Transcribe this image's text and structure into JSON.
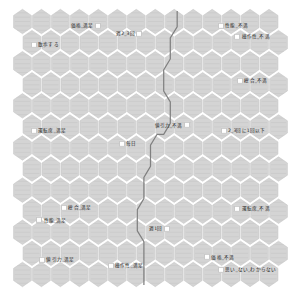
{
  "figure": {
    "title": "",
    "type": "self-organizing-map",
    "background_color": "#ffffff",
    "hex_fill_color": "#d4d4d4",
    "hex_stroke_color": "#c2c2c2",
    "hex_pattern_color": "#c9c9c9",
    "cluster_boundary_color": "#808080",
    "marker_color": "#ffffff",
    "label_color": "#1a1a1a",
    "grid_columns": 14,
    "grid_rows": 13
  },
  "chart_data": {
    "type": "heatmap",
    "title": "",
    "xlabel": "",
    "ylabel": "",
    "grid": {
      "shape": "hexagonal",
      "columns": 14,
      "rows": 13,
      "offset_rows": "odd"
    },
    "legend": "none",
    "annotations": [
      {
        "label": "価格_満足",
        "x": 0.21,
        "y": 0.055,
        "marker_side": "right"
      },
      {
        "label": "散歩する",
        "x": 0.065,
        "y": 0.125,
        "marker_side": "left"
      },
      {
        "label": "週2_3回",
        "x": 0.375,
        "y": 0.085,
        "marker_side": "right"
      },
      {
        "label": "性能_不満",
        "x": 0.745,
        "y": 0.055,
        "marker_side": "left"
      },
      {
        "label": "操作性_不満",
        "x": 0.805,
        "y": 0.095,
        "marker_side": "left"
      },
      {
        "label": "総合_不満",
        "x": 0.815,
        "y": 0.255,
        "marker_side": "left"
      },
      {
        "label": "運転席_満足",
        "x": 0.065,
        "y": 0.437,
        "marker_side": "left"
      },
      {
        "label": "値引力_不満",
        "x": 0.515,
        "y": 0.418,
        "marker_side": "right"
      },
      {
        "label": "2_3回に1回以下",
        "x": 0.755,
        "y": 0.437,
        "marker_side": "left"
      },
      {
        "label": "毎日",
        "x": 0.385,
        "y": 0.487,
        "marker_side": "left"
      },
      {
        "label": "総合_満足",
        "x": 0.175,
        "y": 0.718,
        "marker_side": "left"
      },
      {
        "label": "運転席_不満",
        "x": 0.805,
        "y": 0.723,
        "marker_side": "left"
      },
      {
        "label": "性能_満足",
        "x": 0.085,
        "y": 0.765,
        "marker_side": "left"
      },
      {
        "label": "週1回",
        "x": 0.495,
        "y": 0.795,
        "marker_side": "right"
      },
      {
        "label": "値引力_満足",
        "x": 0.095,
        "y": 0.908,
        "marker_side": "left"
      },
      {
        "label": "操作性_満足",
        "x": 0.345,
        "y": 0.932,
        "marker_side": "left"
      },
      {
        "label": "価格_不満",
        "x": 0.695,
        "y": 0.9,
        "marker_side": "left"
      },
      {
        "label": "思い_ない_わからない",
        "x": 0.745,
        "y": 0.945,
        "marker_side": "left"
      }
    ],
    "cluster_boundary_path": [
      [
        0.597,
        0.0
      ],
      [
        0.597,
        0.058
      ],
      [
        0.572,
        0.098
      ],
      [
        0.572,
        0.175
      ],
      [
        0.548,
        0.215
      ],
      [
        0.548,
        0.292
      ],
      [
        0.572,
        0.332
      ],
      [
        0.572,
        0.41
      ],
      [
        0.548,
        0.45
      ],
      [
        0.524,
        0.45
      ],
      [
        0.5,
        0.49
      ],
      [
        0.5,
        0.567
      ],
      [
        0.476,
        0.607
      ],
      [
        0.476,
        0.685
      ],
      [
        0.452,
        0.725
      ],
      [
        0.452,
        0.802
      ],
      [
        0.476,
        0.842
      ],
      [
        0.476,
        0.92
      ],
      [
        0.476,
        1.0
      ]
    ]
  }
}
